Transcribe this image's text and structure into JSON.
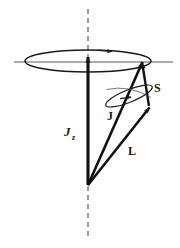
{
  "figure": {
    "background_color": "#ffffff",
    "stroke_color": "#1a1a1a"
  },
  "labels": {
    "jz": "J",
    "jz_subscript": "z",
    "j": "J",
    "l": "L",
    "s": "S"
  },
  "elements": {
    "axis_name": "dashed vertical z-axis",
    "big_ellipse_name": "precession cone base ellipse of J about z",
    "small_ellipse_name": "precession ellipse of L and S about J",
    "horizontal_line_name": "horizontal reference line"
  },
  "geometry": {
    "apex": {
      "x": 88,
      "y": 185
    },
    "big_ellipse": {
      "cx": 88,
      "cy": 61,
      "rx": 63,
      "ry": 11
    },
    "small_ellipse": {
      "cx": 129,
      "cy": 96,
      "rx": 25,
      "ry": 6,
      "rotation_deg": -22
    },
    "horizontal_line": {
      "x1": 14,
      "x2": 173,
      "y": 62
    },
    "dashed_axis": {
      "x": 88,
      "y_top": 9,
      "y_bottom": 240
    },
    "vector_jz": {
      "x1": 88,
      "y1": 185,
      "x2": 88,
      "y2": 55
    },
    "vector_j": {
      "x1": 88,
      "y1": 185,
      "x2": 143,
      "y2": 60
    },
    "vector_l": {
      "x1": 88,
      "y1": 185,
      "x2": 150,
      "y2": 107
    },
    "vector_s": {
      "x1": 149,
      "y1": 106,
      "x2": 142,
      "y2": 61
    }
  },
  "label_positions": {
    "jz": {
      "x": 66,
      "y": 134
    },
    "j": {
      "x": 108,
      "y": 117
    },
    "l": {
      "x": 129,
      "y": 152
    },
    "s": {
      "x": 155,
      "y": 89
    }
  }
}
